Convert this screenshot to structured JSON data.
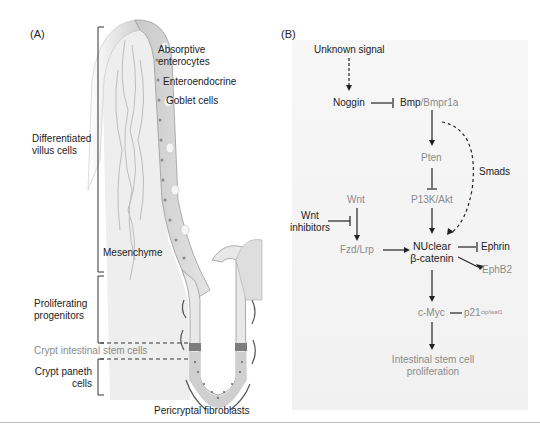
{
  "panel_a": {
    "letter": "(A)",
    "labels": {
      "absorptive": [
        "Absorptive",
        "enterocytes"
      ],
      "enteroendocrine": "Enteroendocrine",
      "goblet": "Goblet cells",
      "differentiated": [
        "Differentiated",
        "villus cells"
      ],
      "mesenchyme": "Mesenchyme",
      "proliferating": [
        "Proliferating",
        "progenitors"
      ],
      "stem": "Crypt intestinal stem cells",
      "paneth": [
        "Crypt paneth",
        "cells"
      ],
      "fibroblasts": "Pericryptal fibroblasts"
    }
  },
  "panel_b": {
    "letter": "(B)",
    "nodes": {
      "unknown_signal": "Unknown signal",
      "noggin": "Noggin",
      "bmp": "Bmp",
      "bmpr1a": "/Bmpr1a",
      "pten": "Pten",
      "smads": "Smads",
      "wnt": "Wnt",
      "wnt_inhibitors": [
        "Wnt",
        "inhibitors"
      ],
      "pi3k": "P13K/Akt",
      "fzd": "Fzd/Lrp",
      "nuclear": [
        "NUclear",
        "β-catenin"
      ],
      "ephrin": "Ephrin",
      "ephb2": "EphB2",
      "cmyc": "c-Myc",
      "p21": "p21",
      "p21_sup": "cip/waf1",
      "output": [
        "Intestinal stem cell",
        "proliferation"
      ]
    },
    "colors": {
      "active": "#222222",
      "inactive": "#8a8a8a"
    }
  }
}
